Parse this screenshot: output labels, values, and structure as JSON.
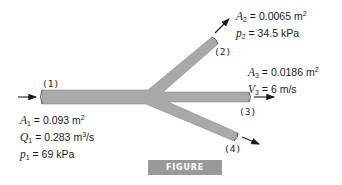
{
  "figure": {
    "caption": "FIGURE P4.6.81",
    "colors": {
      "pipe": "#a9a9a9",
      "pipe_edge": "#7a7a7a",
      "caption_bg": "#999999",
      "text": "#1a1a1a"
    }
  },
  "sections": [
    {
      "id": "1",
      "label": "(1)",
      "lines": [
        {
          "sym": "A",
          "sub": "1",
          "eq": " = 0.093 m",
          "sup": "2",
          "tail": ""
        },
        {
          "sym": "Q",
          "sub": "1",
          "eq": " = 0.283 m",
          "sup": "3",
          "tail": "/s"
        },
        {
          "sym": "p",
          "sub": "1",
          "eq": " = 69 kPa",
          "sup": "",
          "tail": ""
        }
      ]
    },
    {
      "id": "2",
      "label": "(2)",
      "lines": [
        {
          "sym": "A",
          "sub": "2",
          "eq": " = 0.0065 m",
          "sup": "2",
          "tail": ""
        },
        {
          "sym": "p",
          "sub": "2",
          "eq": " = 34.5 kPa",
          "sup": "",
          "tail": ""
        }
      ]
    },
    {
      "id": "3",
      "label": "(3)",
      "lines": [
        {
          "sym": "A",
          "sub": "3",
          "eq": " = 0.0186 m",
          "sup": "2",
          "tail": ""
        },
        {
          "sym": "V",
          "sub": "3",
          "eq": " = 6 m/s",
          "sup": "",
          "tail": ""
        }
      ]
    },
    {
      "id": "4",
      "label": "(4)",
      "lines": []
    }
  ]
}
